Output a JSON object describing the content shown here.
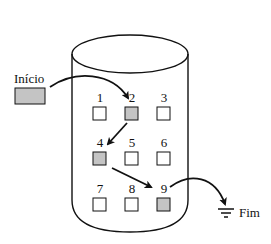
{
  "diagram": {
    "start_label": "Início",
    "end_label": "Fim",
    "colors": {
      "filled": "#c4c4c4",
      "empty": "#ffffff",
      "stroke": "#111111"
    },
    "cells": [
      {
        "id": "1",
        "label": "1",
        "filled": false
      },
      {
        "id": "2",
        "label": "2",
        "filled": true
      },
      {
        "id": "3",
        "label": "3",
        "filled": false
      },
      {
        "id": "4",
        "label": "4",
        "filled": true
      },
      {
        "id": "5",
        "label": "5",
        "filled": false
      },
      {
        "id": "6",
        "label": "6",
        "filled": false
      },
      {
        "id": "7",
        "label": "7",
        "filled": false
      },
      {
        "id": "8",
        "label": "8",
        "filled": false
      },
      {
        "id": "9",
        "label": "9",
        "filled": true
      }
    ],
    "path": [
      "Início",
      "2",
      "4",
      "9",
      "Fim"
    ],
    "end_icon": "ground-icon"
  }
}
